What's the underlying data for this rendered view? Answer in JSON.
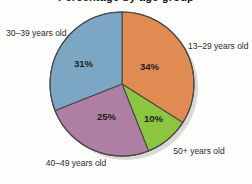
{
  "chart_data": {
    "type": "pie",
    "title": "Percentage by age group",
    "title_clipped": true,
    "categories": [
      "13–29 years old",
      "50+ years old",
      "40–49 years old",
      "30–39 years old"
    ],
    "values": [
      34,
      10,
      25,
      31
    ],
    "value_labels": [
      "34%",
      "10%",
      "25%",
      "31%"
    ],
    "unit": "percent",
    "legend": "none",
    "grid": false,
    "start_angle_deg": 0,
    "direction": "clockwise",
    "slices": [
      {
        "label": "13–29 years old",
        "value": 34,
        "value_label": "34%",
        "color": "#e08b52",
        "label_position": "right"
      },
      {
        "label": "50+ years old",
        "value": 10,
        "value_label": "10%",
        "color": "#8cc63f",
        "label_position": "bottom-right"
      },
      {
        "label": "40–49 years old",
        "value": 25,
        "value_label": "25%",
        "color": "#ae7fa3",
        "label_position": "bottom-left"
      },
      {
        "label": "30–39 years old",
        "value": 31,
        "value_label": "31%",
        "color": "#7ba7c4",
        "label_position": "left"
      }
    ]
  },
  "style": {
    "background": "#fdfdfc",
    "slice_stroke": "#4a4a4a",
    "shadow": "#b9b9b4",
    "text": "#2b2b2b"
  }
}
